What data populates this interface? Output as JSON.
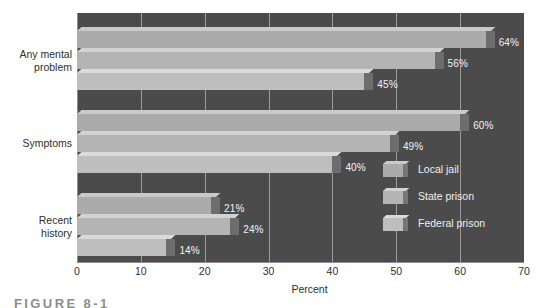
{
  "figure": {
    "caption": "FIGURE 8-1"
  },
  "chart_data": {
    "type": "bar",
    "orientation": "horizontal",
    "title": "",
    "xlabel": "Percent",
    "ylabel": "",
    "xlim": [
      0,
      70
    ],
    "xticks": [
      0,
      10,
      20,
      30,
      40,
      50,
      60,
      70
    ],
    "xtick_labels": [
      "0",
      "10",
      "20",
      "30",
      "40",
      "50",
      "60",
      "70"
    ],
    "grid": true,
    "legend_position": "bottom-right",
    "categories": [
      "Any mental problem",
      "Symptoms",
      "Recent history"
    ],
    "series": [
      {
        "name": "Local jail",
        "color": "#ababab",
        "values": [
          64,
          60,
          21
        ],
        "labels": [
          "64%",
          "60%",
          "21%"
        ]
      },
      {
        "name": "State prison",
        "color": "#b4b4b4",
        "values": [
          56,
          49,
          24
        ],
        "labels": [
          "56%",
          "49%",
          "24%"
        ]
      },
      {
        "name": "Federal prison",
        "color": "#bebebe",
        "values": [
          45,
          40,
          14
        ],
        "labels": [
          "45%",
          "40%",
          "14%"
        ]
      }
    ],
    "plot_background": "#4b4b4b",
    "gridline_color": "#9a9a9a"
  }
}
